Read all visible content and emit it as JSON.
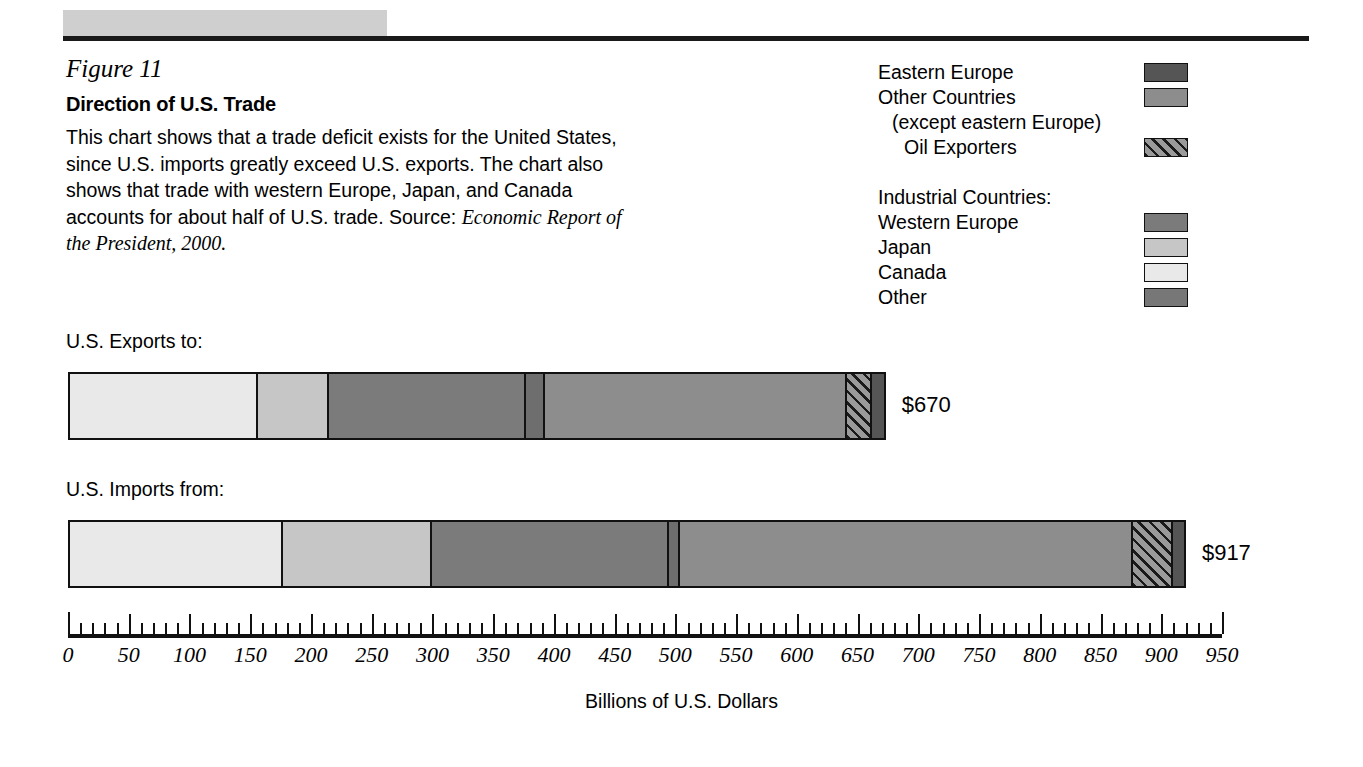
{
  "figure": {
    "number": "Figure 11",
    "title": "Direction of U.S. Trade",
    "description": "This chart shows that a trade deficit exists for the United States, since U.S. imports greatly exceed U.S. exports. The chart also shows that trade with western Europe, Japan, and Canada accounts for about half of U.S. trade. Source:",
    "source": "Economic Report of the President, 2000."
  },
  "legend": {
    "items": [
      {
        "label": "Eastern Europe",
        "swatch": "solid",
        "color": "#555555",
        "indent": 0,
        "has_swatch": true
      },
      {
        "label": "Other Countries",
        "swatch": "solid",
        "color": "#8d8d8d",
        "indent": 0,
        "has_swatch": true
      },
      {
        "label": "(except eastern Europe)",
        "swatch": "none",
        "color": "",
        "indent": 1,
        "has_swatch": false
      },
      {
        "label": "Oil Exporters",
        "swatch": "hatch",
        "color": "#9a9a9a",
        "indent": 2,
        "has_swatch": true
      },
      {
        "label": "Industrial Countries:",
        "swatch": "none",
        "color": "",
        "indent": 0,
        "has_swatch": false
      },
      {
        "label": "Western Europe",
        "swatch": "solid",
        "color": "#7b7b7b",
        "indent": 0,
        "has_swatch": true
      },
      {
        "label": "Japan",
        "swatch": "solid",
        "color": "#c6c6c6",
        "indent": 0,
        "has_swatch": true
      },
      {
        "label": "Canada",
        "swatch": "solid",
        "color": "#e9e9e9",
        "indent": 0,
        "has_swatch": true
      },
      {
        "label": "Other",
        "swatch": "solid",
        "color": "#777777",
        "indent": 0,
        "has_swatch": true
      }
    ]
  },
  "chart_data": {
    "type": "bar",
    "orientation": "horizontal",
    "stacked": true,
    "title": "Direction of U.S. Trade",
    "xlabel": "Billions of U.S. Dollars",
    "ylabel": "",
    "xlim": [
      0,
      950
    ],
    "xticks": [
      0,
      50,
      100,
      150,
      200,
      250,
      300,
      350,
      400,
      450,
      500,
      550,
      600,
      650,
      700,
      750,
      800,
      850,
      900,
      950
    ],
    "xtick_labels": [
      "0",
      "50",
      "100",
      "150",
      "200",
      "250",
      "300",
      "350",
      "400",
      "450",
      "500",
      "550",
      "600",
      "650",
      "700",
      "750",
      "800",
      "850",
      "900",
      "950"
    ],
    "minor_tick_step": 10,
    "grid": false,
    "legend_position": "top-right",
    "categories": [
      "U.S. Exports to:",
      "U.S. Imports from:"
    ],
    "series": [
      {
        "name": "Canada",
        "color": "#e9e9e9",
        "pattern": "solid",
        "values": [
          155,
          175
        ]
      },
      {
        "name": "Japan",
        "color": "#c6c6c6",
        "pattern": "solid",
        "values": [
          58,
          123
        ]
      },
      {
        "name": "Western Europe",
        "color": "#7b7b7b",
        "pattern": "solid",
        "values": [
          162,
          195
        ]
      },
      {
        "name": "Other",
        "color": "#6e6e6e",
        "pattern": "solid",
        "values": [
          16,
          9
        ]
      },
      {
        "name": "Other Countries",
        "color": "#8d8d8d",
        "pattern": "solid",
        "values": [
          249,
          373
        ]
      },
      {
        "name": "Oil Exporters",
        "color": "#9a9a9a",
        "pattern": "hatch",
        "values": [
          20,
          33
        ]
      },
      {
        "name": "Eastern Europe",
        "color": "#555555",
        "pattern": "solid",
        "values": [
          10,
          9
        ]
      }
    ],
    "totals": [
      670,
      917
    ],
    "total_labels": [
      "$670",
      "$917"
    ]
  },
  "bars": [
    {
      "label": "U.S. Exports to:",
      "total_label": "$670"
    },
    {
      "label": "U.S. Imports from:",
      "total_label": "$917"
    }
  ],
  "axis": {
    "title": "Billions of U.S. Dollars"
  }
}
